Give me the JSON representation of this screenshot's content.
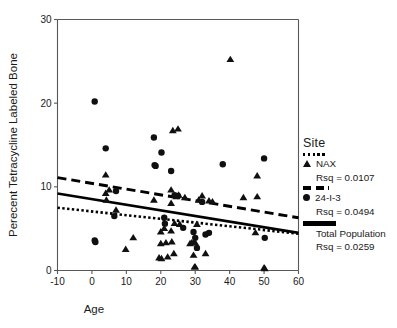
{
  "chart_data": {
    "type": "scatter",
    "title": "",
    "xlabel": "Age",
    "ylabel": "Perecent Tetracycline Labeled Bone",
    "xlim": [
      -10,
      60
    ],
    "ylim": [
      0,
      30
    ],
    "xticks": [
      -10,
      0,
      10,
      20,
      30,
      40,
      50,
      60
    ],
    "yticks": [
      0,
      10,
      20,
      30
    ],
    "grid": false,
    "legend_position": "right",
    "legend_title": "Site",
    "series": [
      {
        "name": "NAX",
        "marker": "triangle",
        "fit_line_style": "dotted",
        "rsq_label": "Rsq = 0.0107",
        "rsq": 0.0107,
        "points": [
          [
            4.0,
            11.4
          ],
          [
            4.0,
            9.2
          ],
          [
            4.2,
            8.4
          ],
          [
            5.0,
            9.6
          ],
          [
            7.0,
            7.2
          ],
          [
            9.8,
            2.5
          ],
          [
            12.0,
            3.9
          ],
          [
            18.0,
            8.4
          ],
          [
            19.5,
            1.5
          ],
          [
            20.0,
            4.6
          ],
          [
            20.0,
            3.2
          ],
          [
            20.2,
            1.4
          ],
          [
            21.0,
            5.0
          ],
          [
            21.5,
            3.3
          ],
          [
            22.0,
            1.6
          ],
          [
            23.0,
            9.6
          ],
          [
            23.0,
            8.0
          ],
          [
            23.0,
            4.7
          ],
          [
            23.2,
            3.4
          ],
          [
            23.5,
            16.7
          ],
          [
            23.8,
            2.0
          ],
          [
            24.0,
            5.6
          ],
          [
            24.5,
            8.8
          ],
          [
            25.0,
            16.9
          ],
          [
            25.2,
            9.0
          ],
          [
            25.5,
            5.5
          ],
          [
            27.0,
            8.7
          ],
          [
            28.5,
            3.2
          ],
          [
            29.0,
            3.3
          ],
          [
            29.5,
            3.3
          ],
          [
            29.5,
            1.8
          ],
          [
            29.8,
            0.4
          ],
          [
            30.0,
            3.3
          ],
          [
            30.0,
            0.4
          ],
          [
            30.5,
            5.5
          ],
          [
            31.0,
            8.4
          ],
          [
            32.0,
            8.9
          ],
          [
            33.0,
            2.0
          ],
          [
            34.0,
            8.3
          ],
          [
            35.0,
            8.2
          ],
          [
            40.2,
            25.2
          ],
          [
            44.0,
            8.7
          ],
          [
            47.5,
            4.5
          ],
          [
            48.0,
            11.3
          ],
          [
            48.0,
            8.8
          ],
          [
            50.0,
            0.3
          ],
          [
            50.2,
            0.2
          ]
        ],
        "fit_endpoints": [
          [
            -10,
            7.5
          ],
          [
            60,
            4.4
          ]
        ]
      },
      {
        "name": "24-I-3",
        "marker": "circle",
        "fit_line_style": "dashed",
        "rsq_label": "Rsq = 0.0494",
        "rsq": 0.0494,
        "points": [
          [
            0.8,
            20.2
          ],
          [
            0.8,
            3.6
          ],
          [
            1.0,
            3.4
          ],
          [
            4.0,
            14.6
          ],
          [
            6.5,
            6.5
          ],
          [
            7.0,
            9.5
          ],
          [
            18.0,
            15.9
          ],
          [
            18.2,
            12.6
          ],
          [
            18.5,
            12.5
          ],
          [
            20.2,
            14.1
          ],
          [
            21.0,
            6.3
          ],
          [
            21.2,
            5.6
          ],
          [
            23.0,
            11.9
          ],
          [
            24.0,
            9.0
          ],
          [
            25.0,
            8.9
          ],
          [
            26.5,
            5.1
          ],
          [
            29.5,
            4.6
          ],
          [
            30.0,
            3.9
          ],
          [
            30.5,
            2.7
          ],
          [
            32.0,
            8.2
          ],
          [
            33.0,
            4.3
          ],
          [
            34.0,
            4.5
          ],
          [
            38.0,
            12.7
          ],
          [
            50.0,
            13.4
          ],
          [
            50.2,
            3.9
          ]
        ],
        "fit_endpoints": [
          [
            -10,
            11.1
          ],
          [
            60,
            6.3
          ]
        ]
      },
      {
        "name": "Total Population",
        "marker": "none",
        "fit_line_style": "solid",
        "rsq_label": "Rsq = 0.0259",
        "rsq": 0.0259,
        "points": [],
        "fit_endpoints": [
          [
            -10,
            9.2
          ],
          [
            60,
            4.5
          ]
        ]
      }
    ]
  },
  "axes": {
    "x_label": "Age",
    "y_label": "Perecent Tetracycline Labeled Bone",
    "x_ticks": [
      "-10",
      "0",
      "10",
      "20",
      "30",
      "40",
      "50",
      "60"
    ],
    "y_ticks": [
      "0",
      "10",
      "20",
      "30"
    ]
  },
  "legend": {
    "title": "Site",
    "entries": [
      {
        "name": "NAX",
        "rsq": "Rsq = 0.0107",
        "swatch": "dotted-line",
        "marker": "triangle-marker"
      },
      {
        "name": "24-I-3",
        "rsq": "Rsq = 0.0494",
        "swatch": "dashed-line",
        "marker": "circle-marker"
      },
      {
        "name": "Total Population",
        "rsq": "Rsq = 0.0259",
        "swatch": "solid-line",
        "marker": "none"
      }
    ]
  },
  "colors": {
    "marker": "#101010",
    "axis": "#58585a",
    "text": "#1a1a1a",
    "background": "#ffffff"
  }
}
